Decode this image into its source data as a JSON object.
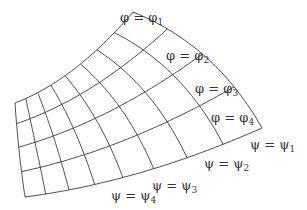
{
  "diagram": {
    "phi_labels": [
      {
        "text": "φ = φ",
        "sub": "1",
        "x": 120,
        "y": 22
      },
      {
        "text": "φ = φ",
        "sub": "2",
        "x": 166,
        "y": 60
      },
      {
        "text": "φ = φ",
        "sub": "3",
        "x": 195,
        "y": 93
      },
      {
        "text": "φ = φ",
        "sub": "4",
        "x": 211,
        "y": 122
      }
    ],
    "psi_labels": [
      {
        "text": "ψ = ψ",
        "sub": "1",
        "x": 250,
        "y": 149
      },
      {
        "text": "ψ = ψ",
        "sub": "2",
        "x": 204,
        "y": 168
      },
      {
        "text": "ψ = ψ",
        "sub": "3",
        "x": 152,
        "y": 190
      },
      {
        "text": "ψ = ψ",
        "sub": "4",
        "x": 111,
        "y": 200
      }
    ],
    "grid": {
      "phi_curve_count": 5,
      "psi_curve_count": 9,
      "line_color": "#3a3a3a"
    }
  }
}
